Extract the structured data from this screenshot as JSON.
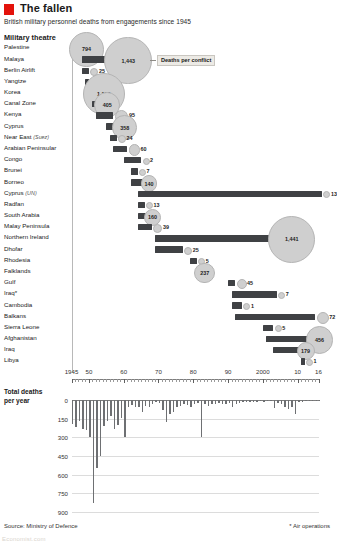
{
  "header": {
    "title": "The fallen",
    "subtitle": "British military personnel deaths from engagements since 1945",
    "section_heading": "Military theatre",
    "accent_color": "#e3120b"
  },
  "callout": {
    "text": "Deaths per conflict"
  },
  "footer": {
    "source": "Source: Ministry of Defence",
    "footnote": "* Air operations",
    "wordmark": "Economist.com"
  },
  "chart_data": [
    {
      "type": "bar",
      "name": "conflict-timeline",
      "title": "Military theatre",
      "orientation": "horizontal-gantt",
      "xlabel": "",
      "ylabel": "",
      "xlim": [
        1945,
        2016
      ],
      "xticks": [
        1945,
        1950,
        1960,
        1970,
        1980,
        1990,
        2000,
        2010,
        2016
      ],
      "xticklabels": [
        "1945",
        "50",
        "60",
        "70",
        "80",
        "90",
        "2000",
        "10",
        "16"
      ],
      "grid": false,
      "value_label": "Deaths per conflict",
      "categories": [
        "Palestine",
        "Malaya",
        "Berlin Airlift",
        "Yangtze",
        "Korea",
        "Canal Zone",
        "Kenya",
        "Cyprus",
        "Near East (Suez)",
        "Arabian Peninsular",
        "Congo",
        "Brunei",
        "Borneo",
        "Cyprus (UN)",
        "Radfan",
        "South Arabia",
        "Malay Peninsula",
        "Northern Ireland",
        "Dhofar",
        "Rhodesia",
        "Falklands",
        "Gulf",
        "Iraq*",
        "Cambodia",
        "Balkans",
        "Sierra Leone",
        "Afghanistan",
        "Iraq",
        "Libya"
      ],
      "values": [
        794,
        1443,
        25,
        45,
        1129,
        405,
        95,
        358,
        24,
        60,
        2,
        7,
        140,
        13,
        13,
        160,
        39,
        1441,
        25,
        5,
        237,
        45,
        7,
        1,
        72,
        5,
        456,
        179,
        1
      ],
      "rows": [
        {
          "label": "Palestine",
          "italic": "",
          "start": 1945,
          "end": 1948,
          "deaths": 794,
          "deaths_display": "794"
        },
        {
          "label": "Malaya",
          "italic": "",
          "start": 1948,
          "end": 1960,
          "deaths": 1443,
          "deaths_display": "1,443"
        },
        {
          "label": "Berlin Airlift",
          "italic": "",
          "start": 1948,
          "end": 1949,
          "deaths": 25,
          "deaths_display": "25"
        },
        {
          "label": "Yangtze",
          "italic": "",
          "start": 1949,
          "end": 1949,
          "deaths": 45,
          "deaths_display": "45"
        },
        {
          "label": "Korea",
          "italic": "",
          "start": 1950,
          "end": 1953,
          "deaths": 1129,
          "deaths_display": "1,129"
        },
        {
          "label": "Canal Zone",
          "italic": "",
          "start": 1951,
          "end": 1954,
          "deaths": 405,
          "deaths_display": "405"
        },
        {
          "label": "Kenya",
          "italic": "",
          "start": 1952,
          "end": 1956,
          "deaths": 95,
          "deaths_display": "95"
        },
        {
          "label": "Cyprus",
          "italic": "",
          "start": 1955,
          "end": 1959,
          "deaths": 358,
          "deaths_display": "358"
        },
        {
          "label": "Near East ",
          "italic": "(Suez)",
          "start": 1956,
          "end": 1957,
          "deaths": 24,
          "deaths_display": "24"
        },
        {
          "label": "Arabian Peninsular",
          "italic": "",
          "start": 1957,
          "end": 1960,
          "deaths": 60,
          "deaths_display": "60"
        },
        {
          "label": "Congo",
          "italic": "",
          "start": 1960,
          "end": 1964,
          "deaths": 2,
          "deaths_display": "2"
        },
        {
          "label": "Brunei",
          "italic": "",
          "start": 1962,
          "end": 1963,
          "deaths": 7,
          "deaths_display": "7"
        },
        {
          "label": "Borneo",
          "italic": "",
          "start": 1962,
          "end": 1966,
          "deaths": 140,
          "deaths_display": "140"
        },
        {
          "label": "Cyprus ",
          "italic": "(UN)",
          "start": 1964,
          "end": 2016,
          "deaths": 13,
          "deaths_display": "13"
        },
        {
          "label": "Radfan",
          "italic": "",
          "start": 1964,
          "end": 1965,
          "deaths": 13,
          "deaths_display": "13"
        },
        {
          "label": "South Arabia",
          "italic": "",
          "start": 1964,
          "end": 1967,
          "deaths": 160,
          "deaths_display": "160"
        },
        {
          "label": "Malay Peninsula",
          "italic": "",
          "start": 1964,
          "end": 1967,
          "deaths": 39,
          "deaths_display": "39"
        },
        {
          "label": "Northern Ireland",
          "italic": "",
          "start": 1969,
          "end": 2007,
          "deaths": 1441,
          "deaths_display": "1,441"
        },
        {
          "label": "Dhofar",
          "italic": "",
          "start": 1969,
          "end": 1976,
          "deaths": 25,
          "deaths_display": "25"
        },
        {
          "label": "Rhodesia",
          "italic": "",
          "start": 1979,
          "end": 1980,
          "deaths": 5,
          "deaths_display": "5"
        },
        {
          "label": "Falklands",
          "italic": "",
          "start": 1982,
          "end": 1982,
          "deaths": 237,
          "deaths_display": "237"
        },
        {
          "label": "Gulf",
          "italic": "",
          "start": 1990,
          "end": 1991,
          "deaths": 45,
          "deaths_display": "45"
        },
        {
          "label": "Iraq*",
          "italic": "",
          "start": 1991,
          "end": 2003,
          "deaths": 7,
          "deaths_display": "7"
        },
        {
          "label": "Cambodia",
          "italic": "",
          "start": 1991,
          "end": 1993,
          "deaths": 1,
          "deaths_display": "1"
        },
        {
          "label": "Balkans",
          "italic": "",
          "start": 1992,
          "end": 2014,
          "deaths": 72,
          "deaths_display": "72"
        },
        {
          "label": "Sierra Leone",
          "italic": "",
          "start": 2000,
          "end": 2002,
          "deaths": 5,
          "deaths_display": "5"
        },
        {
          "label": "Afghanistan",
          "italic": "",
          "start": 2001,
          "end": 2015,
          "deaths": 456,
          "deaths_display": "456"
        },
        {
          "label": "Iraq",
          "italic": "",
          "start": 2003,
          "end": 2011,
          "deaths": 179,
          "deaths_display": "179"
        },
        {
          "label": "Libya",
          "italic": "",
          "start": 2011,
          "end": 2011,
          "deaths": 1,
          "deaths_display": "1"
        }
      ]
    },
    {
      "type": "bar",
      "name": "annual-deaths",
      "title": "Total deaths per year",
      "title_lines": [
        "Total deaths",
        "per year"
      ],
      "orientation": "vertical-inverted",
      "xlabel": "",
      "ylabel": "",
      "ylim": [
        0,
        900
      ],
      "y_inverted": true,
      "yticks": [
        0,
        150,
        300,
        450,
        600,
        750,
        900
      ],
      "yticklabels": [
        "0",
        "150",
        "300",
        "450",
        "600",
        "750",
        "900"
      ],
      "grid": true,
      "x": [
        1945,
        1946,
        1947,
        1948,
        1949,
        1950,
        1951,
        1952,
        1953,
        1954,
        1955,
        1956,
        1957,
        1958,
        1959,
        1960,
        1961,
        1962,
        1963,
        1964,
        1965,
        1966,
        1967,
        1968,
        1969,
        1970,
        1971,
        1972,
        1973,
        1974,
        1975,
        1976,
        1977,
        1978,
        1979,
        1980,
        1981,
        1982,
        1983,
        1984,
        1985,
        1986,
        1987,
        1988,
        1989,
        1990,
        1991,
        1992,
        1993,
        1994,
        1995,
        1996,
        1997,
        1998,
        1999,
        2000,
        2001,
        2002,
        2003,
        2004,
        2005,
        2006,
        2007,
        2008,
        2009,
        2010,
        2011,
        2012,
        2013,
        2014,
        2015,
        2016
      ],
      "values": [
        190,
        215,
        170,
        230,
        245,
        295,
        830,
        545,
        450,
        205,
        165,
        130,
        235,
        200,
        145,
        295,
        60,
        40,
        55,
        60,
        100,
        45,
        60,
        35,
        20,
        25,
        80,
        175,
        110,
        95,
        60,
        45,
        35,
        40,
        60,
        35,
        25,
        300,
        35,
        45,
        30,
        30,
        25,
        35,
        30,
        25,
        60,
        30,
        25,
        20,
        15,
        20,
        15,
        15,
        10,
        15,
        10,
        10,
        65,
        25,
        30,
        55,
        70,
        60,
        115,
        20,
        15,
        10,
        5,
        5,
        5,
        5
      ]
    }
  ]
}
